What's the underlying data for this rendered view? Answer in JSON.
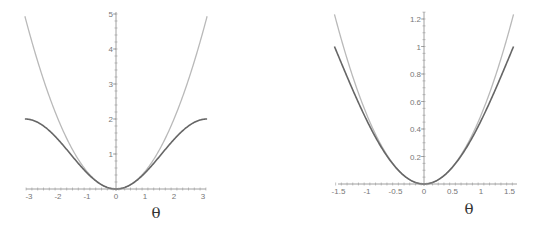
{
  "chart_data": [
    {
      "type": "line",
      "title": "",
      "xlabel": "θ",
      "ylabel": "",
      "xlim": [
        -3.14159,
        3.14159
      ],
      "ylim": [
        0,
        5
      ],
      "grid": false,
      "legend": null,
      "x_ticks": [
        "-3",
        "-2",
        "-1",
        "0",
        "1",
        "2",
        "3"
      ],
      "y_ticks": [
        "1",
        "2",
        "3",
        "4",
        "5"
      ],
      "series": [
        {
          "name": "θ^2/2",
          "color": "#b4b4b4",
          "x": [
            -3.14,
            -3,
            -2.5,
            -2,
            -1.5,
            -1,
            -0.5,
            0,
            0.5,
            1,
            1.5,
            2,
            2.5,
            3,
            3.14
          ],
          "values": [
            4.93,
            4.5,
            3.125,
            2,
            1.125,
            0.5,
            0.125,
            0,
            0.125,
            0.5,
            1.125,
            2,
            3.125,
            4.5,
            4.93
          ]
        },
        {
          "name": "1 - cos(θ)",
          "color": "#666666",
          "x": [
            -3.14,
            -3,
            -2.5,
            -2,
            -1.5,
            -1,
            -0.5,
            0,
            0.5,
            1,
            1.5,
            2,
            2.5,
            3,
            3.14
          ],
          "values": [
            2,
            1.99,
            1.8,
            1.42,
            0.93,
            0.46,
            0.12,
            0,
            0.12,
            0.46,
            0.93,
            1.42,
            1.8,
            1.99,
            2
          ]
        }
      ]
    },
    {
      "type": "line",
      "title": "",
      "xlabel": "θ",
      "ylabel": "",
      "xlim": [
        -1.5708,
        1.5708
      ],
      "ylim": [
        0,
        1.25
      ],
      "grid": false,
      "legend": null,
      "x_ticks": [
        "-1.5",
        "-1",
        "-0.5",
        "0",
        "0.5",
        "1",
        "1.5"
      ],
      "y_ticks": [
        "0.2",
        "0.4",
        "0.6",
        "0.8",
        "1",
        "1.2"
      ],
      "series": [
        {
          "name": "θ^2/2",
          "color": "#b4b4b4",
          "x": [
            -1.57,
            -1.25,
            -1,
            -0.75,
            -0.5,
            -0.25,
            0,
            0.25,
            0.5,
            0.75,
            1,
            1.25,
            1.57
          ],
          "values": [
            1.23,
            0.78,
            0.5,
            0.28,
            0.125,
            0.031,
            0,
            0.031,
            0.125,
            0.28,
            0.5,
            0.78,
            1.23
          ]
        },
        {
          "name": "1 - cos(θ)",
          "color": "#666666",
          "x": [
            -1.57,
            -1.25,
            -1,
            -0.75,
            -0.5,
            -0.25,
            0,
            0.25,
            0.5,
            0.75,
            1,
            1.25,
            1.57
          ],
          "values": [
            1,
            0.68,
            0.46,
            0.27,
            0.12,
            0.031,
            0,
            0.031,
            0.12,
            0.27,
            0.46,
            0.68,
            1
          ]
        }
      ]
    }
  ],
  "plots": {
    "left": {
      "xlabel": "θ",
      "x_ticks": [
        "-3",
        "-2",
        "-1",
        "0",
        "1",
        "2",
        "3"
      ],
      "y_ticks": [
        "1",
        "2",
        "3",
        "4",
        "5"
      ]
    },
    "right": {
      "xlabel": "θ",
      "x_ticks": [
        "-1.5",
        "-1",
        "-0.5",
        "0",
        "0.5",
        "1",
        "1.5"
      ],
      "y_ticks": [
        "0.2",
        "0.4",
        "0.6",
        "0.8",
        "1",
        "1.2"
      ]
    }
  }
}
